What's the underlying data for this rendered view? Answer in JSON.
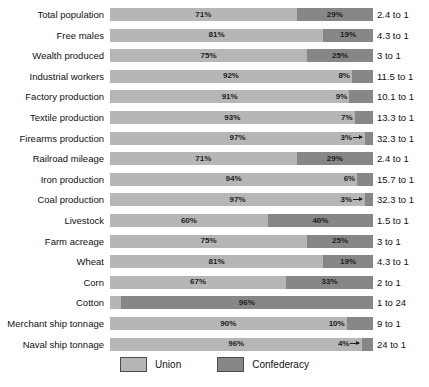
{
  "chart_data": {
    "type": "bar",
    "title": "",
    "subtitle": "",
    "xlabel": "",
    "ylabel": "",
    "xlim": [
      0,
      100
    ],
    "grid": false,
    "orientation": "horizontal",
    "stacked": true,
    "legend_position": "bottom-center",
    "colors": {
      "union": "#b6b6b6",
      "confederacy": "#878787",
      "background": "#ffffff",
      "text": "#111111"
    },
    "series": [
      {
        "name": "Union",
        "values": [
          71,
          81,
          75,
          92,
          91,
          93,
          97,
          71,
          94,
          97,
          60,
          75,
          81,
          67,
          4,
          90,
          96
        ]
      },
      {
        "name": "Confederacy",
        "values": [
          29,
          19,
          25,
          8,
          9,
          7,
          3,
          29,
          6,
          3,
          40,
          25,
          19,
          33,
          96,
          10,
          4
        ]
      }
    ],
    "categories": [
      "Total population",
      "Free males",
      "Wealth produced",
      "Industrial workers",
      "Factory production",
      "Textile production",
      "Firearms production",
      "Railroad mileage",
      "Iron production",
      "Coal production",
      "Livestock",
      "Farm acreage",
      "Wheat",
      "Corn",
      "Cotton",
      "Merchant ship tonnage",
      "Naval ship tonnage"
    ],
    "ratios": [
      "2.4 to 1",
      "4.3 to 1",
      "3 to 1",
      "11.5 to 1",
      "10.1 to 1",
      "13.3 to 1",
      "32.3 to 1",
      "2.4 to 1",
      "15.7 to 1",
      "32.3 to 1",
      "1.5 to 1",
      "3 to 1",
      "4.3 to 1",
      "2 to 1",
      "1 to 24",
      "9 to 1",
      "24 to 1"
    ]
  },
  "rows": [
    {
      "label": "Total population",
      "union": 71,
      "confederacy": 29,
      "union_label": "71%",
      "confederacy_label": "29%",
      "ratio": "2.4 to 1",
      "union_label_mode": "center",
      "confederacy_label_mode": "center"
    },
    {
      "label": "Free males",
      "union": 81,
      "confederacy": 19,
      "union_label": "81%",
      "confederacy_label": "19%",
      "ratio": "4.3 to 1",
      "union_label_mode": "center",
      "confederacy_label_mode": "center"
    },
    {
      "label": "Wealth produced",
      "union": 75,
      "confederacy": 25,
      "union_label": "75%",
      "confederacy_label": "25%",
      "ratio": "3 to 1",
      "union_label_mode": "center",
      "confederacy_label_mode": "center"
    },
    {
      "label": "Industrial workers",
      "union": 92,
      "confederacy": 8,
      "union_label": "92%",
      "confederacy_label": "8%",
      "ratio": "11.5 to 1",
      "union_label_mode": "center",
      "confederacy_label_mode": "center"
    },
    {
      "label": "Factory production",
      "union": 91,
      "confederacy": 9,
      "union_label": "91%",
      "confederacy_label": "9%",
      "ratio": "10.1 to 1",
      "union_label_mode": "center",
      "confederacy_label_mode": "center"
    },
    {
      "label": "Textile production",
      "union": 93,
      "confederacy": 7,
      "union_label": "93%",
      "confederacy_label": "7%",
      "ratio": "13.3 to 1",
      "union_label_mode": "center",
      "confederacy_label_mode": "center"
    },
    {
      "label": "Firearms production",
      "union": 97,
      "confederacy": 3,
      "union_label": "97%",
      "confederacy_label": "3%",
      "ratio": "32.3 to 1",
      "union_label_mode": "center",
      "confederacy_label_mode": "arrow-right"
    },
    {
      "label": "Railroad mileage",
      "union": 71,
      "confederacy": 29,
      "union_label": "71%",
      "confederacy_label": "29%",
      "ratio": "2.4 to 1",
      "union_label_mode": "center",
      "confederacy_label_mode": "center"
    },
    {
      "label": "Iron production",
      "union": 94,
      "confederacy": 6,
      "union_label": "94%",
      "confederacy_label": "6%",
      "ratio": "15.7 to 1",
      "union_label_mode": "center",
      "confederacy_label_mode": "center"
    },
    {
      "label": "Coal production",
      "union": 97,
      "confederacy": 3,
      "union_label": "97%",
      "confederacy_label": "3%",
      "ratio": "32.3 to 1",
      "union_label_mode": "center",
      "confederacy_label_mode": "arrow-right"
    },
    {
      "label": "Livestock",
      "union": 60,
      "confederacy": 40,
      "union_label": "60%",
      "confederacy_label": "40%",
      "ratio": "1.5 to 1",
      "union_label_mode": "center",
      "confederacy_label_mode": "center"
    },
    {
      "label": "Farm acreage",
      "union": 75,
      "confederacy": 25,
      "union_label": "75%",
      "confederacy_label": "25%",
      "ratio": "3 to 1",
      "union_label_mode": "center",
      "confederacy_label_mode": "center"
    },
    {
      "label": "Wheat",
      "union": 81,
      "confederacy": 19,
      "union_label": "81%",
      "confederacy_label": "19%",
      "ratio": "4.3 to 1",
      "union_label_mode": "center",
      "confederacy_label_mode": "center"
    },
    {
      "label": "Corn",
      "union": 67,
      "confederacy": 33,
      "union_label": "67%",
      "confederacy_label": "33%",
      "ratio": "2 to 1",
      "union_label_mode": "center",
      "confederacy_label_mode": "center"
    },
    {
      "label": "Cotton",
      "union": 4,
      "confederacy": 96,
      "union_label": "4%",
      "confederacy_label": "96%",
      "ratio": "1 to 24",
      "union_label_mode": "arrow-left",
      "confederacy_label_mode": "center"
    },
    {
      "label": "Merchant ship tonnage",
      "union": 90,
      "confederacy": 10,
      "union_label": "90%",
      "confederacy_label": "10%",
      "ratio": "9 to 1",
      "union_label_mode": "center",
      "confederacy_label_mode": "center"
    },
    {
      "label": "Naval ship tonnage",
      "union": 96,
      "confederacy": 4,
      "union_label": "96%",
      "confederacy_label": "4%",
      "ratio": "24 to 1",
      "union_label_mode": "center",
      "confederacy_label_mode": "arrow-right"
    }
  ],
  "legend": {
    "items": [
      {
        "label": "Union",
        "color": "#b6b6b6"
      },
      {
        "label": "Confederacy",
        "color": "#878787"
      }
    ]
  }
}
